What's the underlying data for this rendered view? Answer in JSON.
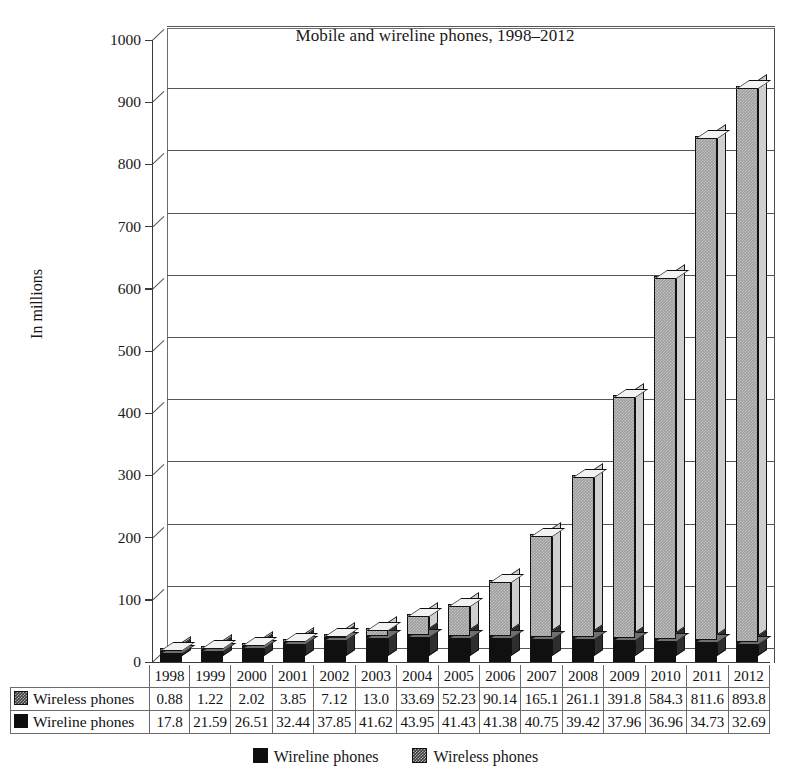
{
  "chart_data": {
    "type": "bar",
    "subtype": "stacked-column-3d",
    "title": "Mobile and wireline phones, 1998–2012",
    "xlabel": "",
    "ylabel": "In millions",
    "ylim": [
      0,
      1000
    ],
    "ytick_step": 100,
    "yticks": [
      "1000",
      "900",
      "800",
      "700",
      "600",
      "500",
      "400",
      "300",
      "200",
      "100",
      "0"
    ],
    "grid": true,
    "legend_position": "bottom",
    "categories": [
      "1998",
      "1999",
      "2000",
      "2001",
      "2002",
      "2003",
      "2004",
      "2005",
      "2006",
      "2007",
      "2008",
      "2009",
      "2010",
      "2011",
      "2012"
    ],
    "series": [
      {
        "name": "Wireline phones",
        "color": "#101010",
        "values": [
          17.8,
          21.59,
          26.51,
          32.44,
          37.85,
          41.62,
          43.95,
          41.43,
          41.38,
          40.75,
          39.42,
          37.96,
          36.96,
          34.73,
          32.69
        ],
        "labels": [
          "17.8",
          "21.59",
          "26.51",
          "32.44",
          "37.85",
          "41.62",
          "43.95",
          "41.43",
          "41.38",
          "40.75",
          "39.42",
          "37.96",
          "36.96",
          "34.73",
          "32.69"
        ]
      },
      {
        "name": "Wireless phones",
        "color": "#9d9d9d",
        "values": [
          0.88,
          1.22,
          2.02,
          3.85,
          7.12,
          13.0,
          33.69,
          52.23,
          90.14,
          165.1,
          261.1,
          391.8,
          584.3,
          811.6,
          893.8
        ],
        "labels": [
          "0.88",
          "1.22",
          "2.02",
          "3.85",
          "7.12",
          "13.0",
          "33.69",
          "52.23",
          "90.14",
          "165.1",
          "261.1",
          "391.8",
          "584.3",
          "811.6",
          "893.8"
        ]
      }
    ]
  },
  "table": {
    "row_label_wireless": "Wireless phones",
    "row_label_wireline": "Wireline phones"
  },
  "legend": {
    "items": [
      {
        "label": "Wireline phones",
        "swatch": "dark-square-icon"
      },
      {
        "label": "Wireless phones",
        "swatch": "gray-hatched-square-icon"
      }
    ]
  }
}
